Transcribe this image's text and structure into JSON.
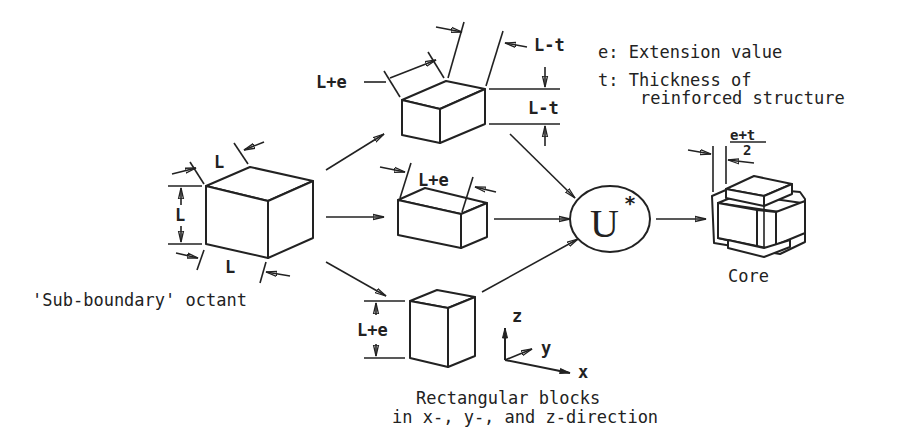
{
  "legend": {
    "e_line": "e: Extension value",
    "t_line1": "t: Thickness of",
    "t_line2": "reinforced structure"
  },
  "octant": {
    "label": "'Sub-boundary' octant",
    "dim_top": "L",
    "dim_left": "L",
    "dim_bottom": "L"
  },
  "blocks": {
    "caption_line1": "Rectangular blocks",
    "caption_line2": "in x-, y-, and z-direction",
    "x_block": {
      "dim_label": "L+e",
      "dim_top_right": "L-t",
      "dim_right": "L-t"
    },
    "y_block": {
      "dim_label": "L+e"
    },
    "z_block": {
      "dim_label": "L+e"
    }
  },
  "union": {
    "symbol": "U",
    "superscript": "*"
  },
  "core": {
    "label": "Core",
    "dim_numerator": "e+t",
    "dim_denominator": "2"
  },
  "axes": {
    "x": "x",
    "y": "y",
    "z": "z"
  },
  "colors": {
    "ink": "#222222",
    "background": "#ffffff"
  }
}
